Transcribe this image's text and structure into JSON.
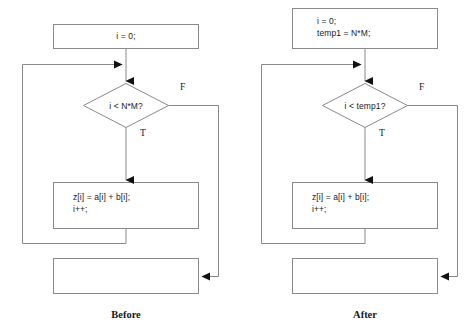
{
  "diagram": {
    "title_visible": false,
    "colors": {
      "background": "#ffffff",
      "stroke": "#8a8a8a",
      "arrow_fill": "#111111",
      "text": "#1a1a1a"
    },
    "panels": [
      {
        "id": "before",
        "caption": "Before",
        "init_box": {
          "lines": [
            "i = 0;"
          ],
          "align": "center"
        },
        "decision": {
          "text": "i < N*M?",
          "true_label": "T",
          "false_label": "F"
        },
        "body_box": {
          "lines": [
            "z[i] = a[i] + b[i];",
            "i++;"
          ],
          "align": "left"
        },
        "exit_box": {
          "lines": [],
          "align": "center"
        }
      },
      {
        "id": "after",
        "caption": "After",
        "init_box": {
          "lines": [
            "i = 0;",
            "temp1 = N*M;"
          ],
          "align": "left"
        },
        "decision": {
          "text": "i < temp1?",
          "true_label": "T",
          "false_label": "F"
        },
        "body_box": {
          "lines": [
            "z[i] = a[i] + b[i];",
            "i++;"
          ],
          "align": "left"
        },
        "exit_box": {
          "lines": [],
          "align": "center"
        }
      }
    ]
  }
}
